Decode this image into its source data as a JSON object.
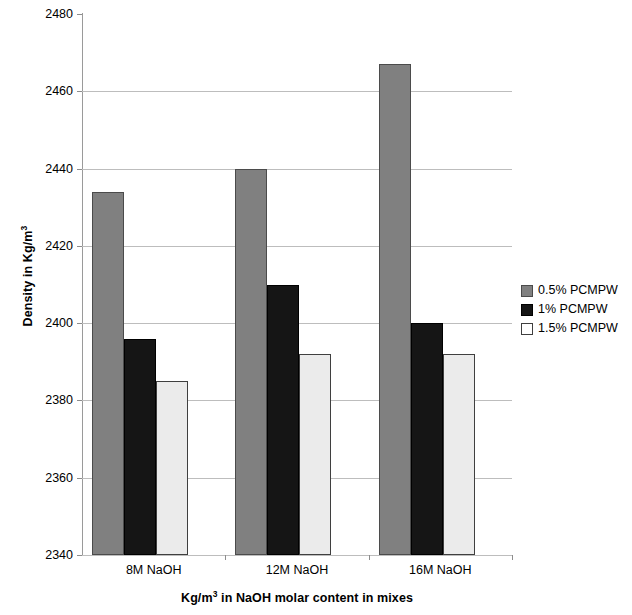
{
  "chart_data": {
    "type": "bar",
    "title": "",
    "categories": [
      "8M NaOH",
      "12M NaOH",
      "16M NaOH"
    ],
    "series": [
      {
        "name": "0.5% PCMPW",
        "color": "#808080",
        "values": [
          2434,
          2440,
          2467
        ]
      },
      {
        "name": "1% PCMPW",
        "color": "#151515",
        "values": [
          2396,
          2410,
          2400
        ]
      },
      {
        "name": "1.5% PCMPW",
        "color": "#ebebeb",
        "values": [
          2385,
          2392,
          2392
        ]
      }
    ],
    "xlabel": "Kg/m3 in NaOH molar content in mixes",
    "xlabel_base": "Kg/m",
    "xlabel_sup": "3",
    "xlabel_rest": " in NaOH molar content in mixes",
    "ylabel": "Density in Kg/m3",
    "ylabel_base": "Density in Kg/m",
    "ylabel_sup": "3",
    "ylim": [
      2340,
      2480
    ],
    "ytick_step": 20,
    "yticks": [
      "2480",
      "2460",
      "2440",
      "2420",
      "2400",
      "2380",
      "2360",
      "2340"
    ],
    "grid": true,
    "legend_position": "right"
  }
}
